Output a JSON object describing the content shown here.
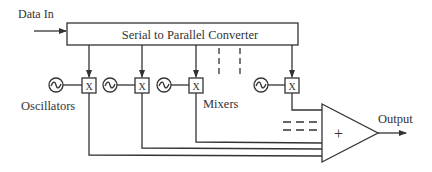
{
  "diagram": {
    "input_label": "Data In",
    "converter_label": "Serial to Parallel Converter",
    "oscillators_label": "Oscillators",
    "mixers_label": "Mixers",
    "mixer_symbol": "X",
    "oscillator_symbol": "~",
    "summer_symbol": "+",
    "output_label": "Output",
    "colors": {
      "stroke": "#333333",
      "background": "#ffffff"
    }
  }
}
